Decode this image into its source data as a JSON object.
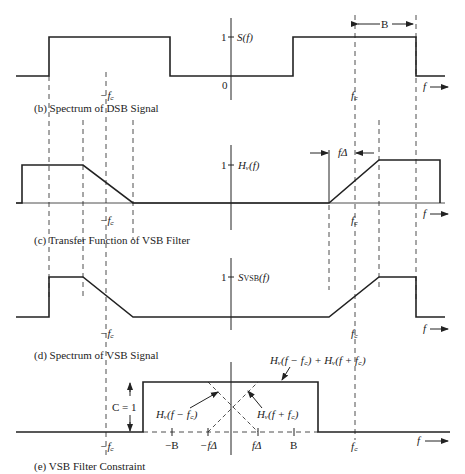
{
  "figure": {
    "panels": [
      {
        "id": "b",
        "caption": "(b) Spectrum of DSB Signal",
        "ylabel": "S(f)",
        "y_tick": "1",
        "origin": "0",
        "bandwidth_label": "B"
      },
      {
        "id": "c",
        "caption": "(c) Transfer Function of VSB Filter",
        "ylabel": "Hᵥ(f)",
        "y_tick": "1",
        "delta_label": "fΔ"
      },
      {
        "id": "d",
        "caption": "(d) Spectrum of VSB Signal",
        "ylabel": "S",
        "ylabel_sub": "VSB",
        "ylabel_tail": "(f)",
        "y_tick": "1"
      },
      {
        "id": "e",
        "caption": "(e) VSB Filter Constraint",
        "sum_label": "Hᵥ(f − f꜀) + Hᵥ(f + f꜀)",
        "left_label": "Hᵥ(f − f꜀)",
        "right_label": "Hᵥ(f + f꜀)",
        "constant_label": "C = 1",
        "ticks": [
          "−B",
          "−fΔ",
          "fΔ",
          "B"
        ]
      }
    ],
    "axis": {
      "f_label": "f",
      "neg_fc": "−f꜀",
      "pos_fc": "f꜀"
    }
  }
}
